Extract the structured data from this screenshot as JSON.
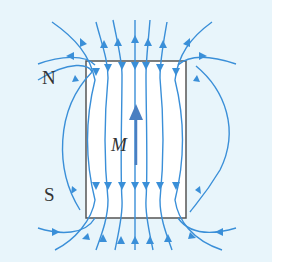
{
  "diagram": {
    "labels": {
      "north": "N",
      "south": "S",
      "magnetization": "M"
    },
    "colors": {
      "background": "#e8f5fb",
      "block_fill": "#ffffff",
      "block_outline": "#555555",
      "field_lines": "#3a8fd8",
      "magnetization_arrow": "#4a7fc1"
    },
    "elements": {
      "block": "rectangular magnet block (outline)",
      "magnetization_vector": "arrow pointing up inside block",
      "field_lines": "field lines enter the top face and exit the bottom face inside the block; outside they curve around from bottom to top"
    }
  }
}
